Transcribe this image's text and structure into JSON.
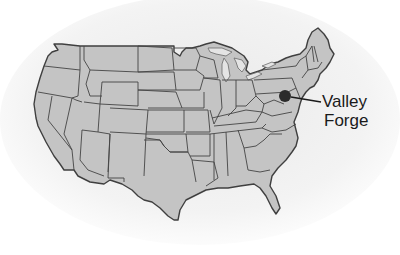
{
  "map": {
    "region": "Contiguous United States",
    "style": "grayscale state-outline map",
    "colors": {
      "land": "#c4c4c4",
      "borders": "#4a4a4a",
      "water_shadow": "#e6e6e6",
      "marker": "#2b2b2b",
      "background": "#ffffff"
    }
  },
  "marker": {
    "name": "Valley Forge",
    "label_line1": "Valley",
    "label_line2": "Forge",
    "location_state": "Pennsylvania"
  }
}
